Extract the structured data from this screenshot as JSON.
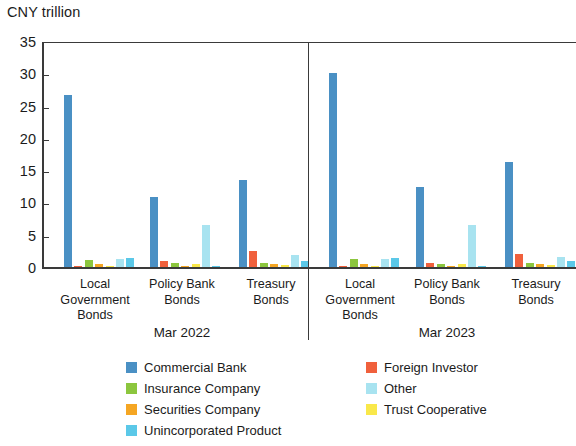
{
  "chart_data": {
    "type": "bar",
    "title": "",
    "subtitle": "",
    "unit_label": "CNY trillion",
    "ylabel": "CNY trillion",
    "xlabel": "",
    "grid": false,
    "legend_position": "bottom",
    "ylim": [
      0,
      35
    ],
    "yticks": [
      0,
      5,
      10,
      15,
      20,
      25,
      30,
      35
    ],
    "ytick_labels": [
      "0",
      "5",
      "10",
      "15",
      "20",
      "25",
      "30",
      "35"
    ],
    "periods": [
      "Mar 2022",
      "Mar 2023"
    ],
    "categories": [
      "Local Government Bonds",
      "Policy Bank Bonds",
      "Treasury Bonds",
      "Local Government Bonds",
      "Policy Bank Bonds",
      "Treasury Bonds"
    ],
    "category_lines": [
      [
        "Local",
        "Government",
        "Bonds"
      ],
      [
        "Policy Bank",
        "Bonds"
      ],
      [
        "Treasury",
        "Bonds"
      ],
      [
        "Local",
        "Government",
        "Bonds"
      ],
      [
        "Policy Bank",
        "Bonds"
      ],
      [
        "Treasury",
        "Bonds"
      ]
    ],
    "series": [
      {
        "name": "Commercial Bank",
        "color": "#4a90c4",
        "values": [
          26.7,
          10.9,
          13.5,
          30.1,
          12.4,
          16.2
        ]
      },
      {
        "name": "Foreign Investor",
        "color": "#f0603c",
        "values": [
          0.05,
          0.9,
          2.5,
          0.05,
          0.6,
          2.0
        ]
      },
      {
        "name": "Insurance Company",
        "color": "#8cc63e",
        "values": [
          1.1,
          0.6,
          0.6,
          1.3,
          0.5,
          0.6
        ]
      },
      {
        "name": "Securities Company",
        "color": "#f5a623",
        "values": [
          0.4,
          0.1,
          0.45,
          0.45,
          0.15,
          0.4
        ]
      },
      {
        "name": "Trust Cooperative",
        "color": "#f9e84a",
        "values": [
          0.1,
          0.5,
          0.35,
          0.1,
          0.45,
          0.3
        ]
      },
      {
        "name": "Other",
        "color": "#a8e3f0",
        "values": [
          1.3,
          6.5,
          1.8,
          1.2,
          6.5,
          1.6
        ]
      },
      {
        "name": "Unincorporated Product",
        "color": "#5bc8e8",
        "values": [
          1.4,
          0.15,
          1.0,
          1.4,
          0.15,
          1.0
        ]
      }
    ]
  },
  "legend": {
    "items": [
      {
        "label": "Commercial Bank",
        "color": "#4a90c4"
      },
      {
        "label": "Foreign Investor",
        "color": "#f0603c"
      },
      {
        "label": "Insurance Company",
        "color": "#8cc63e"
      },
      {
        "label": "Other",
        "color": "#a8e3f0"
      },
      {
        "label": "Securities Company",
        "color": "#f5a623"
      },
      {
        "label": "Trust Cooperative",
        "color": "#f9e84a"
      },
      {
        "label": "Unincorporated Product",
        "color": "#5bc8e8"
      }
    ]
  }
}
